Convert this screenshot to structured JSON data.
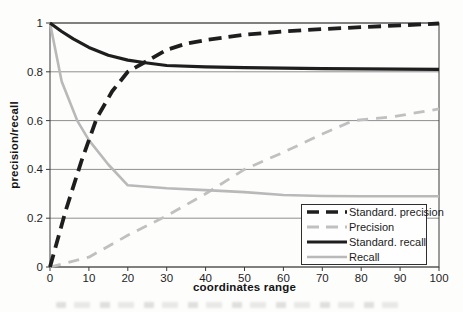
{
  "colors": {
    "background": "#fdfdfc",
    "grid": "#8f8f8f",
    "axis": "#3a3a3a",
    "text": "#1f1f1f",
    "dark_line": "#1e1e1e",
    "light_line": "#bcbcbc",
    "legend_border": "#2e2e2e"
  },
  "chart_data": {
    "type": "line",
    "title": "",
    "xlabel": "coordinates range",
    "ylabel": "precision/recall",
    "xlim": [
      0,
      100
    ],
    "ylim": [
      0,
      1
    ],
    "xticks": [
      0,
      10,
      20,
      30,
      40,
      50,
      60,
      70,
      80,
      90,
      100
    ],
    "xtick_labels": [
      "0",
      "10",
      "20",
      "30",
      "40",
      "50",
      "60",
      "70",
      "80",
      "90",
      "100"
    ],
    "yticks": [
      0,
      0.2,
      0.4,
      0.6,
      0.8,
      1
    ],
    "ytick_labels": [
      "0",
      "0.2",
      "0.4",
      "0.6",
      "0.8",
      "1"
    ],
    "grid": "horizontal",
    "legend_position": "bottom-right-inside",
    "draw_order": [
      1,
      3,
      2,
      0
    ],
    "series": [
      {
        "id": "standard-precision",
        "name": "Standard. precision",
        "style": "dashed",
        "color": "#1e1e1e",
        "width": 3.8,
        "dash": "13 7",
        "points": [
          [
            0,
            0
          ],
          [
            4,
            0.23
          ],
          [
            8,
            0.43
          ],
          [
            12,
            0.61
          ],
          [
            16,
            0.72
          ],
          [
            20,
            0.8
          ],
          [
            25,
            0.845
          ],
          [
            30,
            0.89
          ],
          [
            35,
            0.915
          ],
          [
            40,
            0.93
          ],
          [
            50,
            0.952
          ],
          [
            60,
            0.965
          ],
          [
            70,
            0.975
          ],
          [
            80,
            0.983
          ],
          [
            90,
            0.99
          ],
          [
            100,
            0.998
          ]
        ]
      },
      {
        "id": "precision",
        "name": "Precision",
        "style": "dashed",
        "color": "#c0c0c0",
        "width": 2.8,
        "dash": "11 8",
        "points": [
          [
            0,
            0
          ],
          [
            10,
            0.04
          ],
          [
            20,
            0.13
          ],
          [
            30,
            0.21
          ],
          [
            40,
            0.3
          ],
          [
            50,
            0.4
          ],
          [
            60,
            0.47
          ],
          [
            70,
            0.545
          ],
          [
            78,
            0.6
          ],
          [
            88,
            0.615
          ],
          [
            100,
            0.648
          ]
        ]
      },
      {
        "id": "standard-recall",
        "name": "Standard. recall",
        "style": "solid",
        "color": "#1e1e1e",
        "width": 3.2,
        "dash": "",
        "points": [
          [
            0,
            1.0
          ],
          [
            3,
            0.965
          ],
          [
            6,
            0.935
          ],
          [
            10,
            0.9
          ],
          [
            15,
            0.868
          ],
          [
            20,
            0.848
          ],
          [
            25,
            0.836
          ],
          [
            30,
            0.826
          ],
          [
            40,
            0.82
          ],
          [
            50,
            0.817
          ],
          [
            60,
            0.815
          ],
          [
            70,
            0.813
          ],
          [
            80,
            0.812
          ],
          [
            90,
            0.811
          ],
          [
            100,
            0.81
          ]
        ]
      },
      {
        "id": "recall",
        "name": "Recall",
        "style": "solid",
        "color": "#b9b9b9",
        "width": 2.6,
        "dash": "",
        "points": [
          [
            0,
            1.0
          ],
          [
            3,
            0.76
          ],
          [
            7,
            0.6
          ],
          [
            10,
            0.52
          ],
          [
            15,
            0.42
          ],
          [
            20,
            0.335
          ],
          [
            30,
            0.323
          ],
          [
            40,
            0.315
          ],
          [
            50,
            0.307
          ],
          [
            60,
            0.295
          ],
          [
            70,
            0.291
          ],
          [
            80,
            0.29
          ],
          [
            90,
            0.29
          ],
          [
            100,
            0.29
          ]
        ]
      }
    ]
  }
}
